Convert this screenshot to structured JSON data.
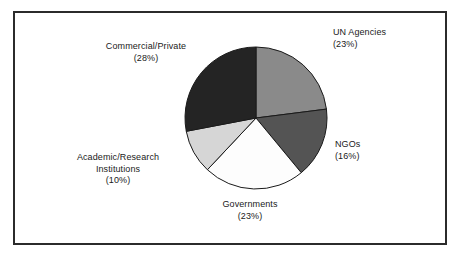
{
  "figure": {
    "background_color": "#ffffff",
    "frame_color": "#2b2b2b"
  },
  "chart_data": {
    "type": "pie",
    "title": "",
    "xlabel": "",
    "ylabel": "",
    "grid": false,
    "legend": "none",
    "labels_position": "outside",
    "start_angle_deg": 0,
    "direction": "clockwise",
    "categories": [
      "UN Agencies",
      "NGOs",
      "Governments",
      "Academic/Research Institutions",
      "Commercial/Private"
    ],
    "values": [
      23,
      16,
      23,
      10,
      28
    ],
    "value_unit": "%",
    "colors": [
      "#8a8a8a",
      "#545454",
      "#fdfdfd",
      "#d6d6d6",
      "#242424"
    ],
    "slice_edge_color": "#1a1a1a",
    "slices": [
      {
        "name": "UN Agencies",
        "value": 23,
        "percent_label": "(23%)",
        "color": "#8a8a8a",
        "start_angle_deg": 0,
        "end_angle_deg": 82.8
      },
      {
        "name": "NGOs",
        "value": 16,
        "percent_label": "(16%)",
        "color": "#545454",
        "start_angle_deg": 82.8,
        "end_angle_deg": 140.4
      },
      {
        "name": "Governments",
        "value": 23,
        "percent_label": "(23%)",
        "color": "#fdfdfd",
        "start_angle_deg": 140.4,
        "end_angle_deg": 223.2
      },
      {
        "name": "Academic/Research Institutions",
        "value": 10,
        "percent_label": "(10%)",
        "color": "#d6d6d6",
        "start_angle_deg": 223.2,
        "end_angle_deg": 259.2
      },
      {
        "name": "Commercial/Private",
        "value": 28,
        "percent_label": "(28%)",
        "color": "#242424",
        "start_angle_deg": 259.2,
        "end_angle_deg": 360
      }
    ]
  },
  "labels": {
    "un_agencies": {
      "line1": "UN Agencies",
      "line2": "(23%)"
    },
    "ngos": {
      "line1": "NGOs",
      "line2": "(16%)"
    },
    "governments": {
      "line1": "Governments",
      "line2": "(23%)"
    },
    "academic": {
      "line1": "Academic/Research",
      "line2": "Institutions",
      "line3": "(10%)"
    },
    "commercial": {
      "line1": "Commercial/Private",
      "line2": "(28%)"
    }
  }
}
